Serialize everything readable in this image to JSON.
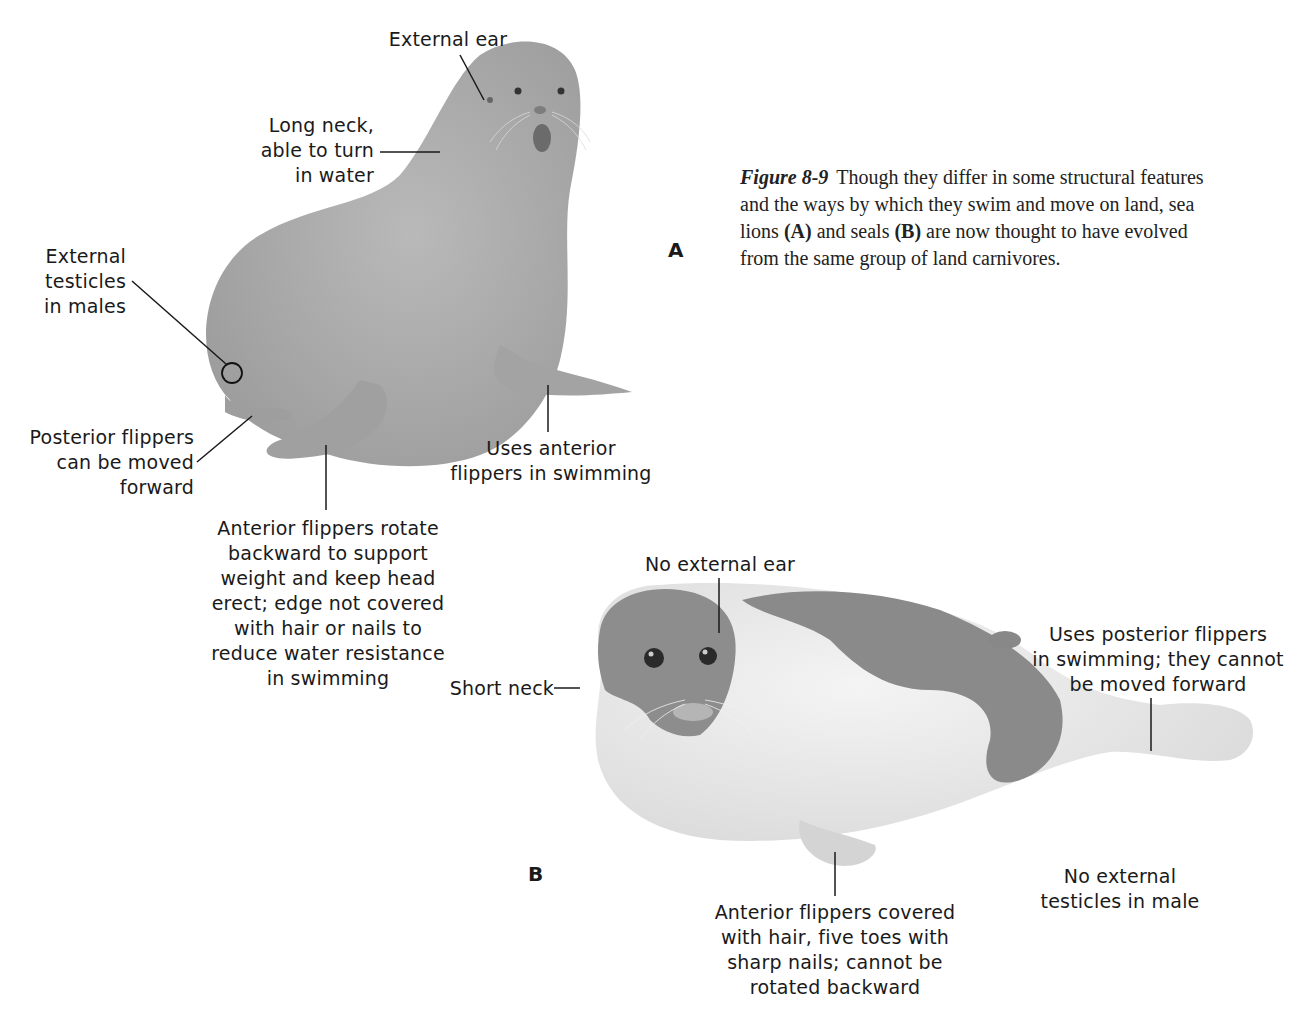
{
  "figure": {
    "number_label": "Figure 8-9",
    "caption_parts": [
      "Though they differ in some structural features and the ways by which they swim and move on land, sea lions ",
      "(A)",
      " and seals ",
      "(B)",
      " are now thought to have evolved from the same group of land carnivores."
    ]
  },
  "panel_a": {
    "letter": "A",
    "subject": "sea lion",
    "labels": {
      "external_ear": [
        "External ear"
      ],
      "long_neck": [
        "Long neck,",
        "able to turn",
        "in water"
      ],
      "external_testicles": [
        "External",
        "testicles",
        "in males"
      ],
      "posterior_flippers": [
        "Posterior flippers",
        "can be moved",
        "forward"
      ],
      "anterior_flippers_swim": [
        "Uses anterior",
        "flippers in swimming"
      ],
      "anterior_flippers_rotate": [
        "Anterior flippers rotate",
        "backward to support",
        "weight and keep head",
        "erect; edge not covered",
        "with hair or nails to",
        "reduce water resistance",
        "in swimming"
      ]
    }
  },
  "panel_b": {
    "letter": "B",
    "subject": "seal",
    "labels": {
      "no_external_ear": [
        "No external ear"
      ],
      "short_neck": [
        "Short neck"
      ],
      "posterior_flippers_swim": [
        "Uses posterior flippers",
        "in swimming; they cannot",
        "be moved forward"
      ],
      "no_external_testicles": [
        "No external",
        "testicles in male"
      ],
      "anterior_flippers_hair": [
        "Anterior flippers covered",
        "with hair, five toes with",
        "sharp nails; cannot be",
        "rotated backward"
      ]
    }
  },
  "colors": {
    "sea_lion_body": "#a9a9a9",
    "seal_body": "#e4e4e4",
    "seal_patch": "#8a8a8a",
    "leader_line": "#1a1a1a"
  }
}
